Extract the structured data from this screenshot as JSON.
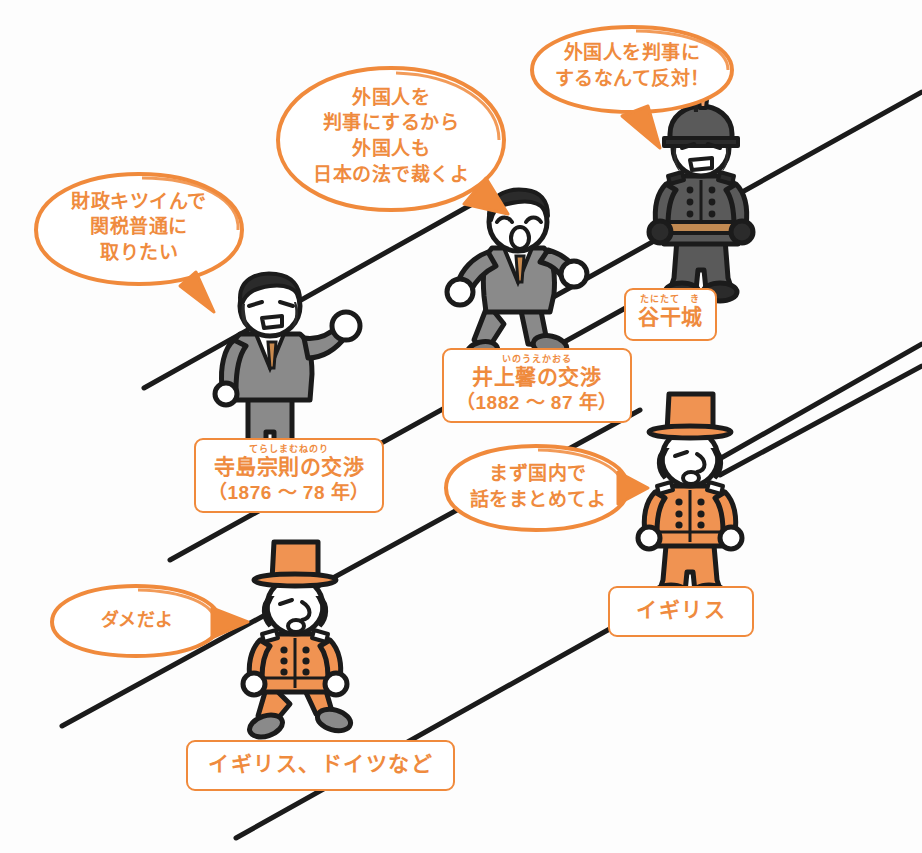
{
  "page": {
    "background_color": "#ffffff",
    "accent_color": "#ef8b3e",
    "line_color": "#1b1b1b",
    "suit_color": "#8a8a8a",
    "uniform_color": "#4a4a4a"
  },
  "diagonal_bands": {
    "count": 4,
    "direction": "lower-left to upper-right",
    "color": "#1b1b1b",
    "stroke_width": 5
  },
  "bubbles": [
    {
      "id": "bubble-tariff",
      "text": "財政キツイんで\n関税普通に\n取りたい",
      "speaker": "terashima",
      "tail": "down-right",
      "color": "#ef8b3e"
    },
    {
      "id": "bubble-judge",
      "text": "外国人を\n判事にするから\n外国人も\n日本の法で裁くよ",
      "speaker": "inoue",
      "tail": "down-left",
      "color": "#ef8b3e"
    },
    {
      "id": "bubble-oppose",
      "text": "外国人を判事に\nするなんて反対！",
      "speaker": "tani-tateki",
      "tail": "down-left",
      "color": "#ef8b3e"
    },
    {
      "id": "bubble-domestic",
      "text": "まず国内で\n話をまとめてよ",
      "speaker": "igirisu",
      "tail": "right",
      "color": "#ef8b3e"
    },
    {
      "id": "bubble-dame",
      "text": "ダメだよ",
      "speaker": "igirisu-doitsu",
      "tail": "right",
      "color": "#ef8b3e"
    }
  ],
  "labels": [
    {
      "id": "label-terashima",
      "furigana": "てらしまむねのり",
      "main": "寺島宗則の交渉",
      "sub": "（1876 〜 78 年）"
    },
    {
      "id": "label-inoue",
      "furigana": "いのうえかおる",
      "main": "井上馨の交渉",
      "sub": "（1882 〜 87 年）"
    },
    {
      "id": "label-tani",
      "furigana": "たにたて　き",
      "main": "谷干城",
      "sub": ""
    },
    {
      "id": "label-igirisu",
      "furigana": "",
      "main": "イギリス",
      "sub": ""
    },
    {
      "id": "label-igirisu-doitsu",
      "furigana": "",
      "main": "イギリス、ドイツなど",
      "sub": ""
    }
  ],
  "figures": [
    {
      "id": "figure-terashima",
      "name": "寺島宗則",
      "type": "japanese-statesman-suit",
      "pose": "standing-fist-raised",
      "body_color": "#8a8a8a",
      "hair_color": "#2b2b2b"
    },
    {
      "id": "figure-inoue",
      "name": "井上馨",
      "type": "japanese-statesman-suit",
      "pose": "running-shouting",
      "body_color": "#8a8a8a",
      "hair_color": "#2b2b2b"
    },
    {
      "id": "figure-tani",
      "name": "谷干城",
      "type": "military-officer",
      "pose": "standing-angry",
      "body_color": "#4f4f4f",
      "hair_color": "#1f1f1f"
    },
    {
      "id": "figure-britain",
      "name": "イギリス",
      "type": "western-diplomat",
      "pose": "standing",
      "body_color": "#f09352",
      "hat_color": "#f09352"
    },
    {
      "id": "figure-britain-germany",
      "name": "イギリス、ドイツなど",
      "type": "western-diplomat",
      "pose": "seated",
      "body_color": "#f09352",
      "hat_color": "#f09352"
    }
  ]
}
